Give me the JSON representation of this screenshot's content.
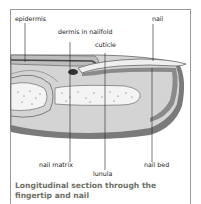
{
  "diagram": {
    "title": "Longitudinal section through the fingertip and nail",
    "labels": {
      "epidermis": "epidermis",
      "dermis_nailfold": "dermis in nailfold",
      "cuticle": "cuticle",
      "nail": "nail",
      "nail_matrix": "nail matrix",
      "lunula": "lunula",
      "nail_bed": "nail bed"
    },
    "colors": {
      "frame": "#9a9a9a",
      "tissue_light": "#d9d9d9",
      "tissue_mid": "#bdbdbd",
      "tissue_dark": "#6a6a6a",
      "caption": "#6e6e66"
    }
  }
}
